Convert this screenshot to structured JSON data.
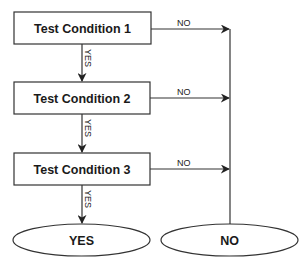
{
  "diagram": {
    "type": "flowchart",
    "colors": {
      "stroke": "#333333",
      "text": "#1a1a1a",
      "background": "#ffffff"
    },
    "nodes": [
      {
        "id": "c1",
        "shape": "rect",
        "label": "Test Condition 1"
      },
      {
        "id": "c2",
        "shape": "rect",
        "label": "Test Condition 2"
      },
      {
        "id": "c3",
        "shape": "rect",
        "label": "Test Condition 3"
      },
      {
        "id": "yes",
        "shape": "ellipse",
        "label": "YES"
      },
      {
        "id": "no",
        "shape": "ellipse",
        "label": "NO"
      }
    ],
    "edges": [
      {
        "from": "c1",
        "to": "c2",
        "label": "YES"
      },
      {
        "from": "c2",
        "to": "c3",
        "label": "YES"
      },
      {
        "from": "c3",
        "to": "yes",
        "label": "YES"
      },
      {
        "from": "c1",
        "to": "no",
        "label": "NO"
      },
      {
        "from": "c2",
        "to": "no",
        "label": "NO"
      },
      {
        "from": "c3",
        "to": "no",
        "label": "NO"
      }
    ]
  }
}
